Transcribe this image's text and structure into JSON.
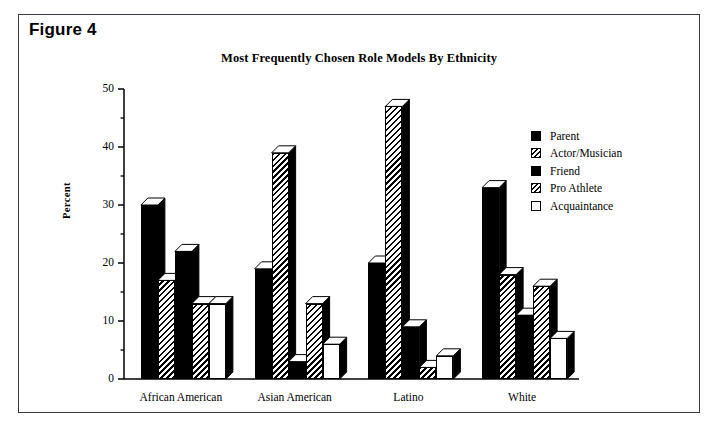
{
  "figure": {
    "label": "Figure 4"
  },
  "chart_data": {
    "type": "bar",
    "title": "Most Frequently Chosen Role Models By Ethnicity",
    "xlabel": "",
    "ylabel": "Percent",
    "ylim": [
      0,
      50
    ],
    "yticks": [
      0,
      10,
      20,
      30,
      40,
      50
    ],
    "yminorticks": [
      5,
      15,
      25,
      35,
      45
    ],
    "grid": false,
    "legend_position": "right",
    "categories": [
      "African American",
      "Asian American",
      "Latino",
      "White"
    ],
    "series": [
      {
        "name": "Parent",
        "pattern": "solid",
        "values": [
          30,
          19,
          20,
          33
        ]
      },
      {
        "name": "Actor/Musician",
        "pattern": "hatch",
        "values": [
          17,
          39,
          47,
          18
        ]
      },
      {
        "name": "Friend",
        "pattern": "solid",
        "values": [
          22,
          3,
          9,
          11
        ]
      },
      {
        "name": "Pro Athlete",
        "pattern": "hatch",
        "values": [
          13,
          13,
          2,
          16
        ]
      },
      {
        "name": "Acquaintance",
        "pattern": "open",
        "values": [
          13,
          6,
          4,
          7
        ]
      }
    ]
  },
  "colors": {
    "frame": "#3a3a42",
    "ink": "#000000",
    "background": "#ffffff"
  }
}
